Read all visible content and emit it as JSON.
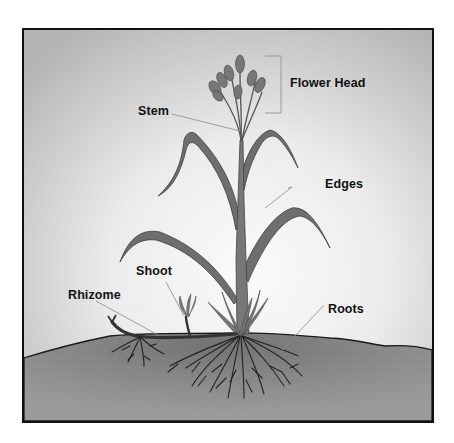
{
  "diagram": {
    "colors": {
      "sky_center": "#f6f6f6",
      "sky_edge": "#b9b9b9",
      "soil": "#8f8f8f",
      "soil_dark": "#777777",
      "leaf": "#6e6e6e",
      "leaf_edge": "#3f3f3f",
      "root": "#2a2a2a",
      "frame": "#111111",
      "leader_line": "#8a8a8a"
    },
    "labels": {
      "flower_head": "Flower Head",
      "stem": "Stem",
      "edges": "Edges",
      "shoot": "Shoot",
      "rhizome": "Rhizome",
      "roots": "Roots"
    }
  }
}
